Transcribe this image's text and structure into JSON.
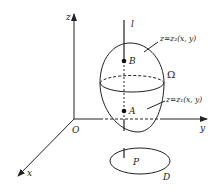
{
  "figure": {
    "axes": {
      "x_label": "x",
      "y_label": "y",
      "z_label": "z",
      "origin_label": "O"
    },
    "line_label": "l",
    "points": {
      "upper": "B",
      "lower": "A",
      "projection": "P"
    },
    "surfaces": {
      "upper": "z=z₂(x, y)",
      "lower": "z=z₁(x, y)"
    },
    "region_label": "Ω",
    "domain_label": "D",
    "colors": {
      "stroke": "#222222",
      "background": "#ffffff"
    }
  }
}
